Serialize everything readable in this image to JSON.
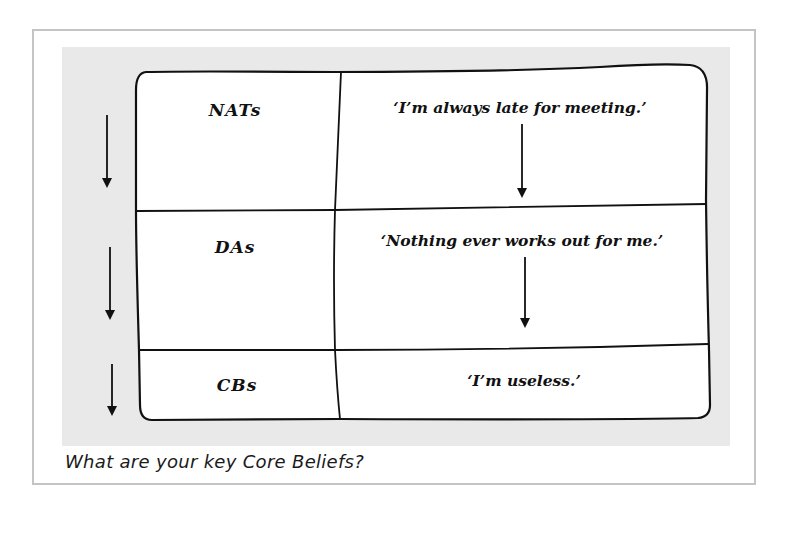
{
  "diagram": {
    "rows": [
      {
        "label": "NATs",
        "statement": "‘I’m always late for meeting.’"
      },
      {
        "label": "DAs",
        "statement": "‘Nothing ever works out for me.’"
      },
      {
        "label": "CBs",
        "statement": "‘I’m useless.’"
      }
    ],
    "colors": {
      "panel": "#e9e9e9",
      "frame": "#c4c4c4",
      "ink": "#111111"
    }
  },
  "caption": "What are your key Core Beliefs?"
}
